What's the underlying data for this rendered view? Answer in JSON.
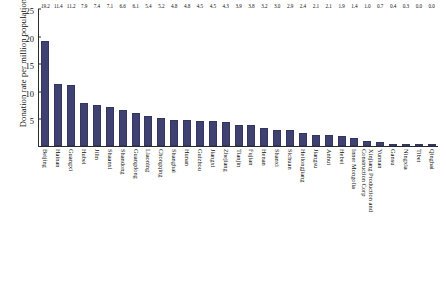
{
  "chart_data": {
    "type": "bar",
    "title": "",
    "subtitle": "",
    "xlabel": "",
    "ylabel": "Donation rate per million population",
    "ylim": [
      0,
      25
    ],
    "ytick_labels": [
      "5",
      "10",
      "15",
      "20",
      "25"
    ],
    "ytick_values": [
      5,
      10,
      15,
      20,
      25
    ],
    "grid": false,
    "legend": "none",
    "bar_color": "#3f4270",
    "axis_color": "#2b2b2b",
    "categories": [
      "Beijing",
      "Hainan",
      "Guangxi",
      "Hubei",
      "Jilin",
      "Shaanxi",
      "Shandong",
      "Guangdong",
      "Liaoning",
      "Chongqing",
      "Shanghai",
      "Hunan",
      "Guizhou",
      "Jiangxi",
      "Zhejiang",
      "Tianjin",
      "Fujian",
      "Henan",
      "Shanxi",
      "Sichuan",
      "Heilongjiang",
      "Jiangsu",
      "Anhui",
      "Hebei",
      "Inner Mongolia",
      "Xinjiang Production and Construction Corp",
      "Yunnan",
      "Gansu",
      "Ningxia",
      "Tibet",
      "Qinghai"
    ],
    "values": [
      19.2,
      11.4,
      11.2,
      7.9,
      7.4,
      7.1,
      6.6,
      6.1,
      5.4,
      5.2,
      4.8,
      4.8,
      4.5,
      4.5,
      4.3,
      3.9,
      3.8,
      3.2,
      3.0,
      2.9,
      2.4,
      2.1,
      2.1,
      1.9,
      1.4,
      1.0,
      0.7,
      0.4,
      0.3,
      0.0,
      0.0
    ],
    "value_labels": [
      "19.2",
      "11.4",
      "11.2",
      "7.9",
      "7.4",
      "7.1",
      "6.6",
      "6.1",
      "5.4",
      "5.2",
      "4.8",
      "4.8",
      "4.5",
      "4.5",
      "4.3",
      "3.9",
      "3.8",
      "3.2",
      "3.0",
      "2.9",
      "2.4",
      "2.1",
      "2.1",
      "1.9",
      "1.4",
      "1.0",
      "0.7",
      "0.4",
      "0.3",
      "0.0",
      "0.0"
    ]
  }
}
